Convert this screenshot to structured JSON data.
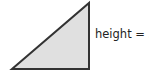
{
  "diagram": {
    "shape": "right-triangle",
    "fill_color": "#e0e0e0",
    "stroke_color": "#333333",
    "vertices": {
      "bottom_left": [
        12,
        69
      ],
      "top_right": [
        89,
        3
      ],
      "bottom_right": [
        89,
        69
      ]
    },
    "height_label": "height = 5"
  }
}
